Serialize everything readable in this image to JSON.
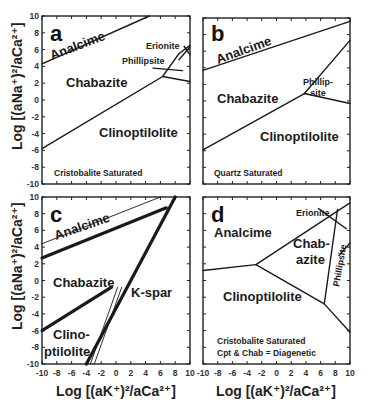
{
  "chart_data": [
    {
      "type": "line",
      "panel": "a",
      "title": "a",
      "xlabel": "Log [(aK+)^2/aCa2+]",
      "ylabel": "Log [(aNa+)^2/aCa2+]",
      "xlim": [
        -10,
        10
      ],
      "ylim": [
        -10,
        10
      ],
      "fields": [
        "Analcime",
        "Chabazite",
        "Clinoptilolite",
        "Phillipsite",
        "Erionite"
      ],
      "note": "Cristobalite Saturated",
      "boundaries": [
        {
          "name": "Analcime/Chabazite",
          "points": [
            [
              -10,
              4.3
            ],
            [
              4.5,
              10
            ]
          ]
        },
        {
          "name": "Chabazite/Clinoptilolite",
          "points": [
            [
              -10,
              -5.8
            ],
            [
              6.3,
              2.8
            ],
            [
              8.5,
              5.5
            ],
            [
              10,
              6.5
            ]
          ]
        },
        {
          "name": "Phillipsite lower",
          "points": [
            [
              6.3,
              2.8
            ],
            [
              10,
              2.2
            ]
          ]
        },
        {
          "name": "Phillipsite upper",
          "points": [
            [
              5,
              3.8
            ],
            [
              9,
              3.5
            ]
          ]
        },
        {
          "name": "Erionite a",
          "points": [
            [
              8.5,
              4.8
            ],
            [
              10,
              6.3
            ]
          ]
        },
        {
          "name": "Erionite b",
          "points": [
            [
              9.2,
              6.4
            ],
            [
              10,
              5.4
            ]
          ]
        }
      ]
    },
    {
      "type": "line",
      "panel": "b",
      "title": "b",
      "xlim": [
        -10,
        10
      ],
      "ylim": [
        -10,
        10
      ],
      "fields": [
        "Analcime",
        "Chabazite",
        "Phillipsite",
        "Clinoptilolite"
      ],
      "note": "Quartz Saturated",
      "boundaries": [
        {
          "name": "Analcime/Chabazite",
          "points": [
            [
              -10,
              3.7
            ],
            [
              10,
              9.6
            ]
          ]
        },
        {
          "name": "Chabazite/Clinoptilolite",
          "points": [
            [
              -10,
              -5.9
            ],
            [
              3.8,
              0.9
            ]
          ]
        },
        {
          "name": "Phillipsite/Clinoptilolite",
          "points": [
            [
              3.8,
              0.9
            ],
            [
              10,
              -0.3
            ]
          ]
        },
        {
          "name": "Chabazite/Phillipsite",
          "points": [
            [
              3.8,
              0.9
            ],
            [
              10,
              7.3
            ]
          ]
        }
      ]
    },
    {
      "type": "line",
      "panel": "c",
      "title": "c",
      "xlabel": "Log [(aK+)^2/aCa2+]",
      "ylabel": "Log [(aNa+)^2/aCa2+]",
      "xlim": [
        -10,
        10
      ],
      "ylim": [
        -10,
        10
      ],
      "x_ticks": [
        -10,
        -8,
        -6,
        -4,
        -2,
        0,
        2,
        4,
        6,
        8,
        10
      ],
      "fields": [
        "Analcime",
        "Chabazite",
        "K-spar",
        "Clinoptilolite"
      ],
      "boundaries": [
        {
          "name": "Analcime/Chabazite (thin)",
          "points": [
            [
              -10,
              4.4
            ],
            [
              6,
              10
            ]
          ]
        },
        {
          "name": "Analcime/Chabazite (thick)",
          "points": [
            [
              -10,
              2.7
            ],
            [
              6.8,
              8.7
            ]
          ]
        },
        {
          "name": "K-spar boundary (thick)",
          "points": [
            [
              -4,
              -10
            ],
            [
              8,
              10
            ]
          ]
        },
        {
          "name": "Chabazite/Clinoptilolite (thick)",
          "points": [
            [
              -10,
              -6
            ],
            [
              -0.6,
              -0.8
            ]
          ]
        },
        {
          "name": "Clinoptilolite/K-spar (double thin)",
          "points": [
            [
              -3.2,
              -10
            ],
            [
              0.5,
              -0.8
            ]
          ]
        }
      ]
    },
    {
      "type": "line",
      "panel": "d",
      "title": "d",
      "xlabel": "Log [(aK+)^2/aCa2+]",
      "xlim": [
        -10,
        10
      ],
      "ylim": [
        -10,
        10
      ],
      "x_ticks": [
        -10,
        -8,
        -6,
        -4,
        -2,
        0,
        2,
        4,
        6,
        8,
        10
      ],
      "fields": [
        "Analcime",
        "Chabazite",
        "Clinoptilolite",
        "Phillipsite",
        "Erionite"
      ],
      "note": [
        "Cristobalite Saturated",
        "Cpt & Chab = Diagenetic"
      ],
      "boundaries": [
        {
          "name": "Analcime/Clinoptilolite",
          "points": [
            [
              -10,
              1.2
            ],
            [
              -2.8,
              1.9
            ]
          ]
        },
        {
          "name": "Analcime/Chabazite",
          "points": [
            [
              -2.8,
              1.9
            ],
            [
              10,
              9.3
            ]
          ]
        },
        {
          "name": "Chabazite/Clinoptilolite",
          "points": [
            [
              -2.8,
              1.9
            ],
            [
              6.5,
              -2.8
            ]
          ]
        },
        {
          "name": "Phillipsite/Clinoptilolite",
          "points": [
            [
              6.5,
              -2.8
            ],
            [
              10,
              -6.2
            ]
          ]
        },
        {
          "name": "Chabazite/Phillipsite",
          "points": [
            [
              6.5,
              -2.8
            ],
            [
              8.3,
              8.5
            ]
          ]
        },
        {
          "name": "Erionite",
          "points": [
            [
              5.7,
              8.6
            ],
            [
              9.5,
              6.2
            ]
          ]
        },
        {
          "name": "Phillipsite upper",
          "points": [
            [
              8.5,
              3.0
            ],
            [
              10,
              4.5
            ]
          ]
        }
      ]
    }
  ],
  "labels": {
    "panel_a": "a",
    "panel_b": "b",
    "panel_c": "c",
    "panel_d": "d",
    "analcime": "Analcime",
    "chabazite": "Chabazite",
    "clinoptilolite": "Clinoptilolite",
    "erionite": "Erionite",
    "phillipsite": "Phillipsite",
    "phillip": "Phillip-",
    "site": "site",
    "kspar": "K-spar",
    "clino": "Clino-",
    "ptilolite": "ptilolite",
    "chab": "Chab-",
    "azite": "azite",
    "cristobalite_saturated": "Cristobalite Saturated",
    "quartz_saturated": "Quartz Saturated",
    "diagenetic": "Cpt & Chab = Diagenetic",
    "ylabel": "Log [(aNa⁺)²/aCa²⁺]",
    "xlabel": "Log [(aK⁺)²/aCa²⁺]"
  },
  "ticks": {
    "y": [
      "10",
      "8",
      "6",
      "4",
      "2",
      "0",
      "-2",
      "-4",
      "-6",
      "-8",
      "-10"
    ],
    "x": [
      "-10",
      "-8",
      "-6",
      "-4",
      "-2",
      "0",
      "2",
      "4",
      "6",
      "8",
      "10"
    ]
  }
}
